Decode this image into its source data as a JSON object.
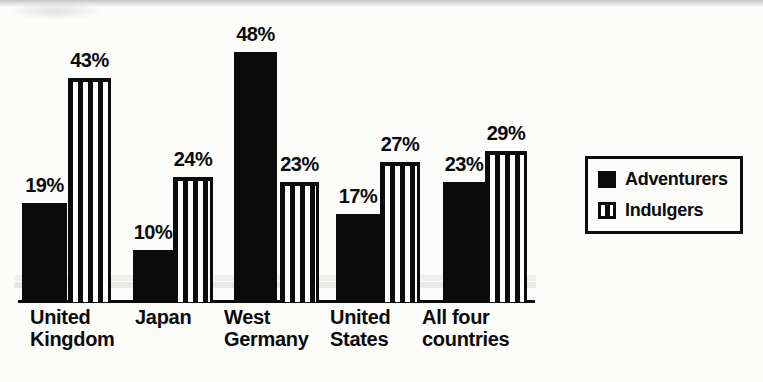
{
  "chart_data": {
    "type": "bar",
    "title": "",
    "xlabel": "",
    "ylabel": "",
    "value_suffix": "%",
    "ylim": [
      0,
      50
    ],
    "grid": false,
    "y_axis_visible": false,
    "x_axis_visible": true,
    "categories": [
      "United Kingdom",
      "Japan",
      "West Germany",
      "United States",
      "All four countries"
    ],
    "category_label_lines": [
      [
        "United",
        "Kingdom"
      ],
      [
        "Japan"
      ],
      [
        "West",
        "Germany"
      ],
      [
        "United",
        "States"
      ],
      [
        "All four",
        "countries"
      ]
    ],
    "series": [
      {
        "name": "Adventurers",
        "style": "solid-black",
        "values": [
          19,
          10,
          48,
          17,
          23
        ]
      },
      {
        "name": "Indulgers",
        "style": "vertical-stripes",
        "values": [
          43,
          24,
          23,
          27,
          29
        ]
      }
    ],
    "data_labels": {
      "Adventurers": [
        "19%",
        "10%",
        "48%",
        "17%",
        "23%"
      ],
      "Indulgers": [
        "43%",
        "24%",
        "23%",
        "27%",
        "29%"
      ]
    },
    "legend": {
      "position": "right",
      "entries": [
        "Adventurers",
        "Indulgers"
      ],
      "boxed": true
    },
    "colors": {
      "ink_black": "#0b0b0b",
      "stripe_white": "#fcfcfb",
      "background": "#fcfcfb"
    }
  }
}
